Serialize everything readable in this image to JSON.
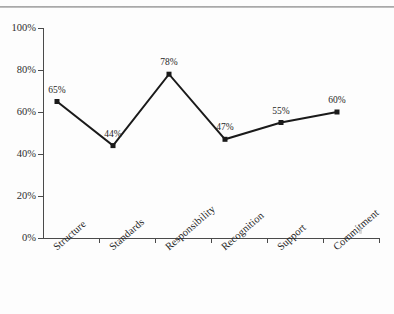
{
  "page": {
    "background_color": "#fdfdfd",
    "rule_color": "#9a9a9a"
  },
  "chart_data": {
    "type": "line",
    "title": "",
    "subtitle": "",
    "xlabel": "",
    "ylabel": "",
    "categories": [
      "Structure",
      "Standards",
      "Responsibility",
      "Recognition",
      "Support",
      "Commitment"
    ],
    "values": [
      65,
      44,
      78,
      47,
      55,
      60
    ],
    "point_labels": [
      "65%",
      "44%",
      "78%",
      "47%",
      "55%",
      "60%"
    ],
    "ylim": [
      0,
      100
    ],
    "ytick_values": [
      0,
      20,
      40,
      60,
      80,
      100
    ],
    "ytick_labels": [
      "0%",
      "20%",
      "40%",
      "60%",
      "80%",
      "100%"
    ],
    "grid": false,
    "legend": "none",
    "series_color": "#1a1a1a",
    "marker": "square",
    "marker_size": 5,
    "line_width": 2,
    "axis_color": "#4a4a4a",
    "annotations": []
  }
}
